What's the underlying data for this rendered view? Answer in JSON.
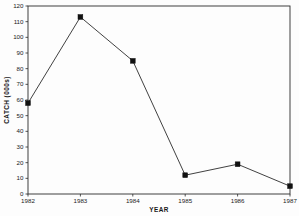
{
  "chart_data": {
    "type": "line",
    "title": "",
    "xlabel": "YEAR",
    "ylabel": "CATCH (000s)",
    "categories": [
      "1982",
      "1983",
      "1984",
      "1985",
      "1986",
      "1987"
    ],
    "x": [
      1982,
      1983,
      1984,
      1985,
      1986,
      1987
    ],
    "values": [
      58,
      113,
      85,
      12,
      19,
      5
    ],
    "series": [
      {
        "name": "CATCH",
        "values": [
          58,
          113,
          85,
          12,
          19,
          5
        ],
        "color": "#1a1a1a",
        "marker": "filled-square",
        "line_style": "solid"
      }
    ],
    "xlim": [
      1982,
      1987
    ],
    "ylim": [
      0,
      120
    ],
    "ytick_labels": [
      "0",
      "10",
      "20",
      "30",
      "40",
      "50",
      "60",
      "70",
      "80",
      "90",
      "100",
      "110",
      "120"
    ],
    "ytick_values": [
      0,
      10,
      20,
      30,
      40,
      50,
      60,
      70,
      80,
      90,
      100,
      110,
      120
    ],
    "xtick_labels": [
      "1982",
      "1983",
      "1984",
      "1985",
      "1986",
      "1987"
    ],
    "grid": false,
    "legend": false,
    "legend_position": "none",
    "frame": "box",
    "background_color": "#fdfdfd",
    "axis_color": "#2b2b2b"
  }
}
